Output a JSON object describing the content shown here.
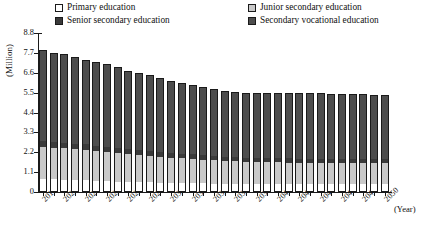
{
  "chart_data": {
    "type": "bar",
    "subtype": "stacked-bar",
    "title": "",
    "xlabel": "(Year)",
    "ylabel": "(Million)",
    "ylim": [
      0,
      8.8
    ],
    "ytick_labels": [
      "0",
      "1.1",
      "2.2",
      "3.3",
      "4.4",
      "5.5",
      "6.6",
      "7.7",
      "8.8"
    ],
    "ytick_values": [
      0,
      1.1,
      2.2,
      3.3,
      4.4,
      5.5,
      6.6,
      7.7,
      8.8
    ],
    "grid": false,
    "legend_position": "top",
    "categories": [
      "2018",
      "2019",
      "2020",
      "2021",
      "2022",
      "2023",
      "2024",
      "2025",
      "2026",
      "2027",
      "2028",
      "2029",
      "2030",
      "2031",
      "2032",
      "2033",
      "2034",
      "2035",
      "2036",
      "2037",
      "2038",
      "2039",
      "2040",
      "2041",
      "2042",
      "2043",
      "2044",
      "2045",
      "2046",
      "2047",
      "2048",
      "2049",
      "2050"
    ],
    "xtick_labels_shown": [
      "2018",
      "2020",
      "2022",
      "2024",
      "2026",
      "2028",
      "2030",
      "2032",
      "2034",
      "2036",
      "2038",
      "2040",
      "2042",
      "2044",
      "2046",
      "2048",
      "2050"
    ],
    "series": [
      {
        "name": "Primary education",
        "color": "#ffffff",
        "values": [
          0.72,
          0.7,
          0.68,
          0.66,
          0.64,
          0.62,
          0.6,
          0.58,
          0.56,
          0.54,
          0.53,
          0.52,
          0.51,
          0.5,
          0.49,
          0.48,
          0.47,
          0.46,
          0.46,
          0.45,
          0.45,
          0.45,
          0.45,
          0.45,
          0.45,
          0.45,
          0.45,
          0.45,
          0.45,
          0.45,
          0.45,
          0.45,
          0.45
        ]
      },
      {
        "name": "Junior secondary education",
        "color": "#c9c9c9",
        "values": [
          1.78,
          1.76,
          1.74,
          1.72,
          1.7,
          1.66,
          1.62,
          1.58,
          1.54,
          1.5,
          1.46,
          1.43,
          1.4,
          1.37,
          1.34,
          1.31,
          1.28,
          1.26,
          1.24,
          1.22,
          1.21,
          1.2,
          1.19,
          1.18,
          1.17,
          1.16,
          1.16,
          1.15,
          1.15,
          1.15,
          1.15,
          1.15,
          1.15
        ]
      },
      {
        "name": "Senior secondary education",
        "color": "#3a3a3a",
        "values": [
          0.32,
          0.31,
          0.31,
          0.3,
          0.3,
          0.29,
          0.29,
          0.28,
          0.28,
          0.27,
          0.27,
          0.26,
          0.26,
          0.26,
          0.25,
          0.25,
          0.25,
          0.24,
          0.24,
          0.24,
          0.24,
          0.23,
          0.23,
          0.23,
          0.23,
          0.23,
          0.22,
          0.22,
          0.22,
          0.22,
          0.22,
          0.22,
          0.22
        ]
      },
      {
        "name": "Secondary vocational education",
        "color": "#4d4d4d",
        "values": [
          5.03,
          4.93,
          4.92,
          4.82,
          4.66,
          4.63,
          4.59,
          4.46,
          4.32,
          4.29,
          4.19,
          4.09,
          3.98,
          3.92,
          3.82,
          3.76,
          3.7,
          3.64,
          3.61,
          3.59,
          3.6,
          3.62,
          3.63,
          3.64,
          3.65,
          3.66,
          3.67,
          3.63,
          3.63,
          3.58,
          3.58,
          3.53,
          3.53
        ]
      }
    ],
    "totals": [
      7.85,
      7.7,
      7.65,
      7.5,
      7.3,
      7.2,
      7.1,
      6.9,
      6.7,
      6.6,
      6.45,
      6.3,
      6.15,
      6.05,
      5.9,
      5.8,
      5.7,
      5.6,
      5.55,
      5.5,
      5.5,
      5.5,
      5.5,
      5.5,
      5.5,
      5.5,
      5.5,
      5.45,
      5.45,
      5.4,
      5.4,
      5.35,
      5.35
    ]
  },
  "legend": {
    "items": [
      {
        "label": "Primary education",
        "color": "#ffffff"
      },
      {
        "label": "Junior secondary education",
        "color": "#c9c9c9"
      },
      {
        "label": "Senior secondary education",
        "color": "#3a3a3a"
      },
      {
        "label": "Secondary vocational education",
        "color": "#4d4d4d"
      }
    ]
  },
  "axes": {
    "y_title": "(Million)",
    "x_title": "(Year)"
  }
}
